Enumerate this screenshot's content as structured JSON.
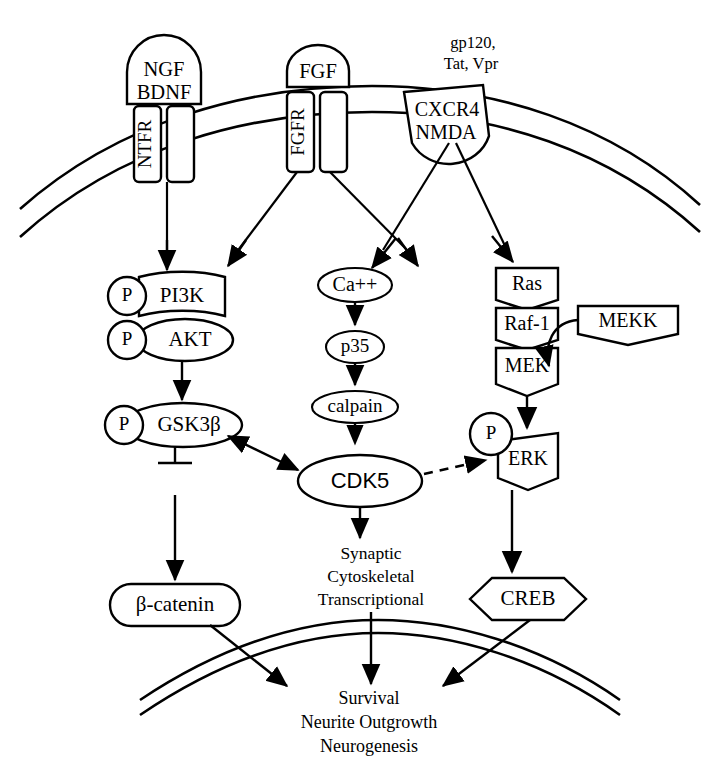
{
  "diagram": {
    "ligands": {
      "ngf_bdnf": "NGF\nBDNF",
      "ngf": "NGF",
      "bdnf": "BDNF",
      "fgf": "FGF",
      "hiv_proteins_line1": "gp120,",
      "hiv_proteins_line2": "Tat, Vpr"
    },
    "receptors": {
      "ntfr": "NTFR",
      "fgfr": "FGFR",
      "cxcr4": "CXCR4",
      "nmda": "NMDA"
    },
    "nodes": {
      "pi3k": "PI3K",
      "akt": "AKT",
      "gsk3b": "GSK3β",
      "beta_catenin": "β-catenin",
      "ca": "Ca++",
      "p35": "p35",
      "calpain": "calpain",
      "cdk5": "CDK5",
      "ras": "Ras",
      "raf1": "Raf-1",
      "mek": "MEK",
      "mekk": "MEKK",
      "erk": "ERK",
      "creb": "CREB",
      "phospho": "P"
    },
    "outputs": {
      "cdk5_effects_line1": "Synaptic",
      "cdk5_effects_line2": "Cytoskeletal",
      "cdk5_effects_line3": "Transcriptional",
      "final_line1": "Survival",
      "final_line2": "Neurite Outgrowth",
      "final_line3": "Neurogenesis"
    },
    "colors": {
      "stroke": "#000000",
      "fill": "#ffffff",
      "background": "#ffffff"
    }
  }
}
